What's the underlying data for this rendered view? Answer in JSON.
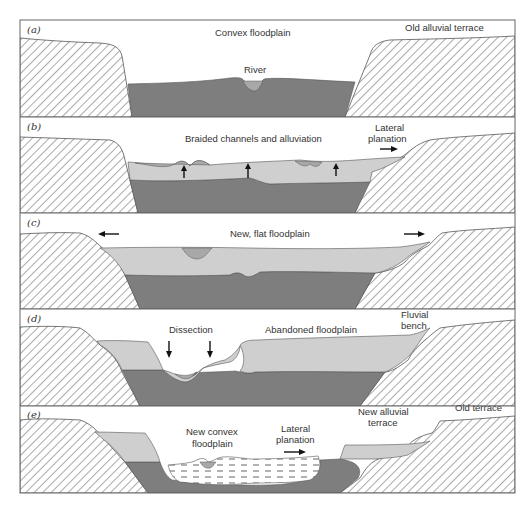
{
  "figure": {
    "colors": {
      "bedrock_hatch": "#555555",
      "old_alluvium_dark": "#7e7e7e",
      "new_alluvium_light": "#cfcfcf",
      "channel_fill": "#a8a8a8",
      "frame": "#666666"
    },
    "panels": [
      {
        "id": "a",
        "label": "(a)",
        "annotations": {
          "center": "Convex floodplain",
          "right": "Old alluvial terrace",
          "river": "River"
        }
      },
      {
        "id": "b",
        "label": "(b)",
        "annotations": {
          "center": "Braided channels and alluviation",
          "right_line1": "Lateral",
          "right_line2": "planation"
        },
        "arrows": [
          "up",
          "up",
          "up",
          "right"
        ]
      },
      {
        "id": "c",
        "label": "(c)",
        "annotations": {
          "center": "New, flat floodplain"
        },
        "arrows": [
          "left",
          "right"
        ]
      },
      {
        "id": "d",
        "label": "(d)",
        "annotations": {
          "dissection": "Dissection",
          "center": "Abandoned floodplain",
          "right_line1": "Fluvial",
          "right_line2": "bench"
        },
        "arrows": [
          "down",
          "down"
        ]
      },
      {
        "id": "e",
        "label": "(e)",
        "annotations": {
          "center_line1": "New convex",
          "center_line2": "floodplain",
          "lateral_line1": "Lateral",
          "lateral_line2": "planation",
          "terrace_line1": "New alluvial",
          "terrace_line2": "terrace",
          "right": "Old terrace"
        },
        "arrows": [
          "right"
        ]
      }
    ]
  }
}
